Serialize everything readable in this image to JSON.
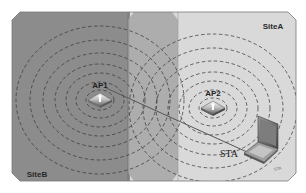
{
  "diagram": {
    "title": "",
    "sites": [
      {
        "id": "siteA",
        "label": "SiteA",
        "color": "#d9d9d9"
      },
      {
        "id": "siteB",
        "label": "SiteB",
        "color": "#8c8c8c"
      }
    ],
    "overlap_color": "#a9a9a9",
    "access_points": [
      {
        "id": "ap1",
        "label": "AP1",
        "site": "SiteB"
      },
      {
        "id": "ap2",
        "label": "AP2",
        "site": "SiteA"
      }
    ],
    "station": {
      "id": "sta",
      "label": "STA",
      "device": "laptop-icon",
      "tiny_label": "STA"
    },
    "connection": {
      "from": "AP1",
      "to": "STA"
    },
    "ring_style": "dashed",
    "ring_color": "#3a3a3a"
  }
}
